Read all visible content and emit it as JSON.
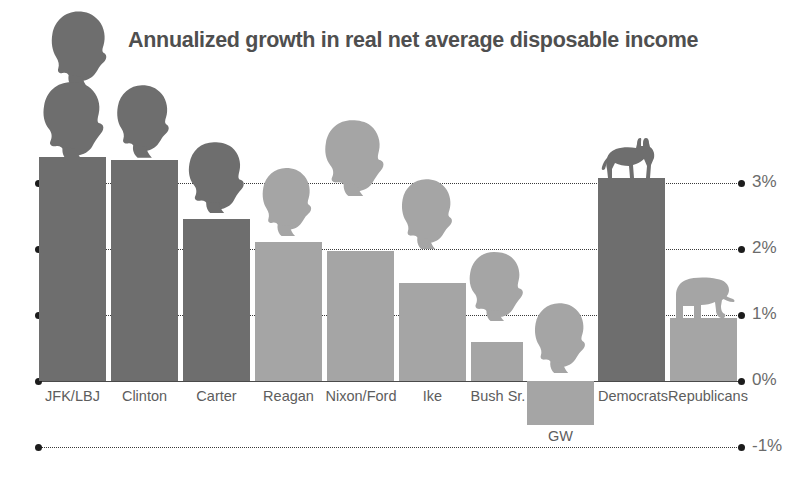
{
  "chart": {
    "title": "Annualized growth in real net average disposable income"
  },
  "chart_data": {
    "type": "bar",
    "title": "Annualized growth in real net average disposable income",
    "xlabel": "",
    "ylabel": "",
    "ylim": [
      -1,
      3.6
    ],
    "grid": true,
    "legend": "none",
    "unit": "%",
    "ytick_labels": [
      "3%",
      "2%",
      "1%",
      "0%",
      "-1%"
    ],
    "ytick_values": [
      3,
      2,
      1,
      0,
      -1
    ],
    "categories": [
      "JFK/LBJ",
      "Clinton",
      "Carter",
      "Reagan",
      "Nixon/Ford",
      "Ike",
      "Bush Sr.",
      "GW",
      "Democrats",
      "Republicans"
    ],
    "values": [
      3.4,
      3.35,
      2.45,
      2.1,
      1.97,
      1.48,
      0.59,
      -0.67,
      3.08,
      0.96
    ],
    "party": [
      "democrat",
      "democrat",
      "democrat",
      "republican",
      "republican",
      "republican",
      "republican",
      "republican",
      "democrat",
      "republican"
    ],
    "colors": {
      "democrat": "#6e6e6e",
      "republican": "#a5a5a5",
      "axis": "#4a4a4a",
      "text": "#5d5d5d",
      "title": "#4f4f4f",
      "background": "#ffffff"
    },
    "annotations": [
      {
        "name": "donkey-mascot",
        "on": "Democrats"
      },
      {
        "name": "elephant-mascot",
        "on": "Republicans"
      },
      {
        "name": "president-head-silhouette",
        "on": "each president bar"
      }
    ]
  },
  "bars": [
    {
      "label": "JFK/LBJ",
      "value": 3.4,
      "party": "democrat"
    },
    {
      "label": "Clinton",
      "value": 3.35,
      "party": "democrat"
    },
    {
      "label": "Carter",
      "value": 2.45,
      "party": "democrat"
    },
    {
      "label": "Reagan",
      "value": 2.1,
      "party": "republican"
    },
    {
      "label": "Nixon/Ford",
      "value": 1.97,
      "party": "republican"
    },
    {
      "label": "Ike",
      "value": 1.48,
      "party": "republican"
    },
    {
      "label": "Bush Sr.",
      "value": 0.59,
      "party": "republican"
    },
    {
      "label": "GW",
      "value": -0.67,
      "party": "republican"
    },
    {
      "label": "Democrats",
      "value": 3.08,
      "party": "democrat"
    },
    {
      "label": "Republicans",
      "value": 0.96,
      "party": "republican"
    }
  ],
  "axis": {
    "ticks": [
      {
        "label": "3%",
        "value": 3
      },
      {
        "label": "2%",
        "value": 2
      },
      {
        "label": "1%",
        "value": 1
      },
      {
        "label": "0%",
        "value": 0
      },
      {
        "label": "-1%",
        "value": -1
      }
    ]
  }
}
